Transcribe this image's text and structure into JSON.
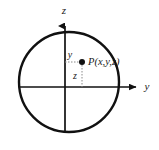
{
  "figure": {
    "background_color": "#ffffff",
    "stroke_color": "#111111",
    "dotted_color": "#8a8a8a",
    "width": 159,
    "height": 150
  },
  "circle": {
    "center_x": 69,
    "center_y": 82,
    "radius": 50,
    "stroke_width": 2.4
  },
  "axes": {
    "origin_x": 65,
    "origin_y": 87,
    "vertical": {
      "label": "z",
      "label_x": 64,
      "label_y": 14,
      "tip_x": 65,
      "tip_y": 19,
      "base_x": 65,
      "base_y": 132
    },
    "horizontal": {
      "label": "y",
      "label_x": 147,
      "label_y": 90,
      "tip_x": 138,
      "tip_y": 87,
      "base_x": 20,
      "base_y": 87
    }
  },
  "point": {
    "label": "P(x,y,z)",
    "dot_x": 82,
    "dot_y": 62,
    "dot_radius": 3,
    "label_x": 88,
    "label_y": 65
  },
  "segments": [
    {
      "name": "horizontal-dotted",
      "label": "y",
      "label_x": 70,
      "label_y": 58,
      "x1": 65,
      "y1": 62,
      "x2": 82,
      "y2": 62
    },
    {
      "name": "vertical-dotted",
      "label": "z",
      "label_x": 75,
      "label_y": 79,
      "x1": 82,
      "y1": 62,
      "x2": 82,
      "y2": 87
    }
  ]
}
